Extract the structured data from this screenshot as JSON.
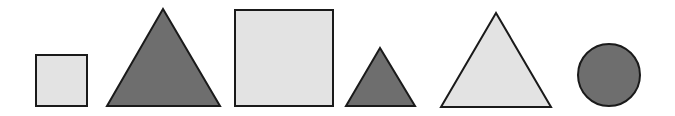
{
  "colors": {
    "light_fill": "#e3e3e3",
    "dark_fill": "#6e6e6e",
    "stroke": "#1a1a1a",
    "background": "#ffffff"
  },
  "shapes": [
    {
      "id": "small-square",
      "type": "square",
      "size": "small",
      "shade": "light",
      "x": 36,
      "y": 55,
      "w": 51,
      "h": 51
    },
    {
      "id": "large-triangle-dark",
      "type": "triangle",
      "size": "large",
      "shade": "dark",
      "points": "163,9 107,106 220,106"
    },
    {
      "id": "large-square",
      "type": "square",
      "size": "large",
      "shade": "light",
      "x": 235,
      "y": 10,
      "w": 98,
      "h": 96
    },
    {
      "id": "small-triangle-dark",
      "type": "triangle",
      "size": "small",
      "shade": "dark",
      "points": "380,48 346,106 415,106"
    },
    {
      "id": "large-triangle-light",
      "type": "triangle",
      "size": "large",
      "shade": "light",
      "points": "496,13 441,107 551,107"
    },
    {
      "id": "circle-dark",
      "type": "circle",
      "size": "medium",
      "shade": "dark",
      "cx": 609,
      "cy": 75,
      "r": 31
    }
  ]
}
